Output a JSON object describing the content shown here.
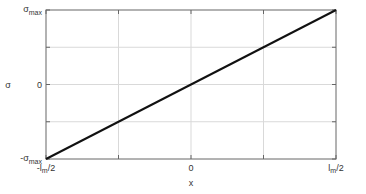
{
  "chart_data": {
    "type": "line",
    "title": "",
    "xlabel": "x",
    "ylabel": "σ",
    "x_ticks": [
      {
        "value": -1,
        "label": "-l",
        "sub": "m",
        "suffix": "/2"
      },
      {
        "value": -0.5,
        "label": "",
        "sub": "",
        "suffix": ""
      },
      {
        "value": 0,
        "label": "0",
        "sub": "",
        "suffix": ""
      },
      {
        "value": 0.5,
        "label": "",
        "sub": "",
        "suffix": ""
      },
      {
        "value": 1,
        "label": "l",
        "sub": "m",
        "suffix": "/2"
      }
    ],
    "y_ticks": [
      {
        "value": -1,
        "label": "-σ",
        "sub": "max"
      },
      {
        "value": -0.5,
        "label": "",
        "sub": ""
      },
      {
        "value": 0,
        "label": "0",
        "sub": ""
      },
      {
        "value": 0.5,
        "label": "",
        "sub": ""
      },
      {
        "value": 1,
        "label": "σ",
        "sub": "max"
      }
    ],
    "xlim": [
      -1,
      1
    ],
    "ylim": [
      -1,
      1
    ],
    "grid": true,
    "legend": null,
    "series": [
      {
        "name": "linear stress distribution",
        "x": [
          -1,
          1
        ],
        "y": [
          -1,
          1
        ],
        "color": "#111111"
      }
    ]
  },
  "colors": {
    "axis": "#666666",
    "grid": "#d9d9d9",
    "line": "#111111",
    "text": "#333333"
  }
}
